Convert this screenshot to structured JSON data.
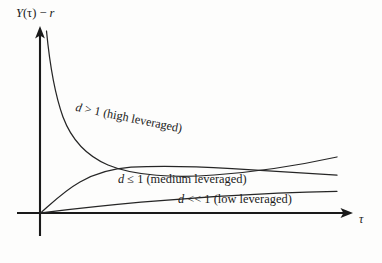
{
  "figure": {
    "type": "line-chart-schematic",
    "background_color": "#fdfdfc",
    "ink_color": "#1a1a1a"
  },
  "axes": {
    "y_label": "Y(τ) − r",
    "x_label": "τ",
    "origin_px": [
      40,
      213
    ],
    "y_axis_top_px": 28,
    "x_axis_right_px": 352,
    "ticks": [],
    "grid": false
  },
  "curves": {
    "high": {
      "label": "d > 1 (high leveraged)"
    },
    "medium": {
      "label": "d ≤ 1 (medium leveraged)"
    },
    "low": {
      "label": "d << 1 (low leveraged)"
    }
  },
  "chart_data": {
    "type": "line",
    "title": "",
    "xlabel": "τ",
    "ylabel": "Y(τ) − r",
    "xlim": [
      0,
      1
    ],
    "ylim": [
      0,
      1
    ],
    "grid": false,
    "legend": "inline-annotations",
    "x": [
      0.0,
      0.05,
      0.1,
      0.15,
      0.2,
      0.3,
      0.4,
      0.5,
      0.6,
      0.7,
      0.8,
      0.9,
      1.0
    ],
    "series": [
      {
        "name": "d > 1 (high leveraged)",
        "annotation": "d > 1 (high leveraged)",
        "values": [
          1.0,
          0.84,
          0.7,
          0.6,
          0.525,
          0.425,
          0.372,
          0.34,
          0.322,
          0.31,
          0.302,
          0.296,
          0.292
        ]
      },
      {
        "name": "d ≤ 1 (medium leveraged)",
        "annotation": "d ≤ 1 (medium leveraged)",
        "values": [
          0.0,
          0.075,
          0.135,
          0.178,
          0.207,
          0.238,
          0.248,
          0.249,
          0.246,
          0.242,
          0.238,
          0.235,
          0.232
        ]
      },
      {
        "name": "d << 1 (low leveraged)",
        "annotation": "d << 1 (low leveraged)",
        "values": [
          0.0,
          0.015,
          0.029,
          0.041,
          0.052,
          0.07,
          0.084,
          0.095,
          0.104,
          0.112,
          0.118,
          0.123,
          0.128
        ]
      }
    ]
  }
}
